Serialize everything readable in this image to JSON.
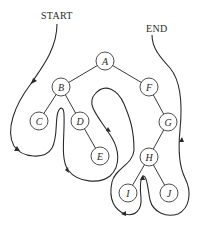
{
  "diagram": {
    "title_start": "START",
    "title_end": "END",
    "type": "binary-tree-traversal",
    "nodes": [
      {
        "id": "A",
        "label": "A",
        "x": 105,
        "y": 61
      },
      {
        "id": "B",
        "label": "B",
        "x": 61,
        "y": 87
      },
      {
        "id": "C",
        "label": "C",
        "x": 39,
        "y": 121
      },
      {
        "id": "D",
        "label": "D",
        "x": 80,
        "y": 121
      },
      {
        "id": "E",
        "label": "E",
        "x": 100,
        "y": 156
      },
      {
        "id": "F",
        "label": "F",
        "x": 149,
        "y": 87
      },
      {
        "id": "G",
        "label": "G",
        "x": 168,
        "y": 122
      },
      {
        "id": "H",
        "label": "H",
        "x": 149,
        "y": 157
      },
      {
        "id": "I",
        "label": "I",
        "x": 128,
        "y": 193
      },
      {
        "id": "J",
        "label": "J",
        "x": 169,
        "y": 193
      }
    ],
    "edges": [
      [
        "A",
        "B"
      ],
      [
        "A",
        "F"
      ],
      [
        "B",
        "C"
      ],
      [
        "B",
        "D"
      ],
      [
        "D",
        "E"
      ],
      [
        "F",
        "G"
      ],
      [
        "G",
        "H"
      ],
      [
        "H",
        "I"
      ],
      [
        "H",
        "J"
      ]
    ],
    "colors": {
      "line": "#3a3a3a",
      "background": "#ffffff"
    }
  }
}
